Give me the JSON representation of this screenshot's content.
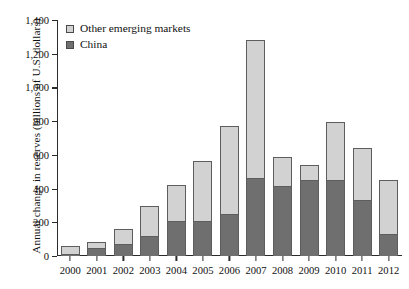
{
  "chart_data": {
    "type": "bar",
    "subtype": "stacked-vertical",
    "title": "",
    "xlabel": "",
    "ylabel": "Annual change in reserves (billions of U.S. dollars)",
    "ylim": [
      0,
      1400
    ],
    "ytick_values": [
      0,
      200,
      400,
      600,
      800,
      1000,
      1200,
      1400
    ],
    "ytick_labels": [
      "0",
      "200",
      "400",
      "600",
      "800",
      "1,000",
      "1,200",
      "1,400"
    ],
    "grid": false,
    "legend_position": "top-left",
    "categories": [
      "2000",
      "2001",
      "2002",
      "2003",
      "2004",
      "2005",
      "2006",
      "2007",
      "2008",
      "2009",
      "2010",
      "2011",
      "2012"
    ],
    "series": [
      {
        "name": "China",
        "color": "#6f6f6f",
        "values": [
          11,
          47,
          74,
          117,
          207,
          209,
          247,
          462,
          418,
          453,
          448,
          334,
          130
        ]
      },
      {
        "name": "Other emerging markets",
        "color": "#d2d2d2",
        "values": [
          46,
          37,
          86,
          178,
          217,
          355,
          523,
          818,
          170,
          85,
          347,
          305,
          320
        ]
      }
    ],
    "totals": [
      57,
      84,
      160,
      295,
      424,
      564,
      770,
      1280,
      588,
      538,
      795,
      639,
      450
    ]
  },
  "legend": {
    "items": [
      {
        "label": "Other emerging markets",
        "color": "#d2d2d2",
        "swatch_name": "legend-swatch-other-emerging-markets"
      },
      {
        "label": "China",
        "color": "#6f6f6f",
        "swatch_name": "legend-swatch-china"
      }
    ]
  },
  "axes": {
    "y_title": "Annual change in reserves (billions of U.S. dollars)"
  }
}
